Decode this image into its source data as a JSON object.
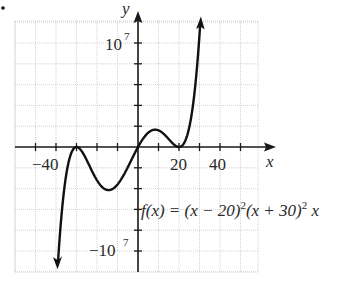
{
  "bullet": "•",
  "chart_data": {
    "type": "line",
    "title": "",
    "function_label": "f(x) = (x − 20)²(x + 30)² x",
    "function_label_parts": {
      "lhs": "f(x) = (x − 20)",
      "exp1": "2",
      "mid": "(x + 30)",
      "exp2": "2",
      "tail": " x"
    },
    "xlabel": "x",
    "ylabel": "y",
    "x_tick_labels": [
      "−40",
      "20",
      "40"
    ],
    "y_tick_labels": [
      {
        "base": "10",
        "exp": "7",
        "value": 10000000
      },
      {
        "base": "−10",
        "exp": "7",
        "value": -10000000
      }
    ],
    "xlim": [
      -60,
      60
    ],
    "ylim": [
      -12000000,
      12000000
    ],
    "x_grid_step": 10,
    "y_grid_step": 2000000,
    "grid": true,
    "roots": [
      -30,
      0,
      20
    ],
    "series": [
      {
        "name": "f(x)",
        "x": [
          -35,
          -30,
          -25,
          -20,
          -15,
          -10,
          -5,
          0,
          5,
          10,
          15,
          20,
          25,
          30
        ],
        "values": [
          -11576250,
          0,
          -2531250,
          -3200000,
          -4134375,
          -3600000,
          -2031250,
          0,
          1406250,
          1600000,
          1265625,
          0,
          791250,
          7500000
        ]
      }
    ],
    "arrows": [
      "left branch → −∞",
      "right branch → +∞"
    ],
    "colors": {
      "curve": "#111111",
      "axis": "#1a1a1a",
      "grid": "#c8c8c8"
    }
  }
}
